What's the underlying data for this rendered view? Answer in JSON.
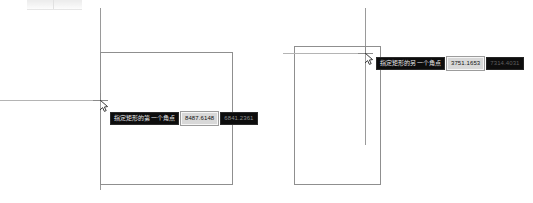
{
  "app": {
    "title": "CAD drawing canvas",
    "background_color": "#ffffff",
    "line_color": "#8f8f8f"
  },
  "toolbar_strip": {
    "name": "cut-off-toolbar"
  },
  "panels": [
    {
      "id": "left",
      "name": "rectangle-first-corner-state",
      "shape": {
        "type": "rectangle",
        "x": 100,
        "y": 52,
        "width": 133,
        "height": 133
      },
      "construction_vertical_line": {
        "x": 100,
        "y_top": 8,
        "y_bottom": 190
      },
      "tracking_horizontal_line": {
        "y": 100,
        "x_left": 0,
        "x_right": 100
      },
      "crosshair": {
        "x": 100,
        "y": 100
      },
      "pointer": {
        "x": 101,
        "y": 101
      },
      "dynamic_input": {
        "prompt": "指定矩形的第一个角点",
        "fields": [
          {
            "value": "8487.6148",
            "state": "active"
          },
          {
            "value": "6841.2361",
            "state": "dim"
          }
        ]
      }
    },
    {
      "id": "right",
      "name": "rectangle-other-corner-state",
      "shape": {
        "type": "rectangle",
        "x": 294,
        "y": 46,
        "width": 87,
        "height": 139
      },
      "construction_vertical_line": {
        "x": 365,
        "y_top": 8,
        "y_bottom": 145
      },
      "tracking_horizontal_line": {
        "y": 53,
        "x_left": 283,
        "x_right": 365
      },
      "crosshair": {
        "x": 365,
        "y": 53
      },
      "pointer": {
        "x": 366,
        "y": 54
      },
      "dynamic_input": {
        "prompt": "指定矩形的另一个角点",
        "fields": [
          {
            "value": "3751.1653",
            "state": "active"
          },
          {
            "value": "7314.4031",
            "state": "dim2"
          }
        ]
      }
    }
  ]
}
